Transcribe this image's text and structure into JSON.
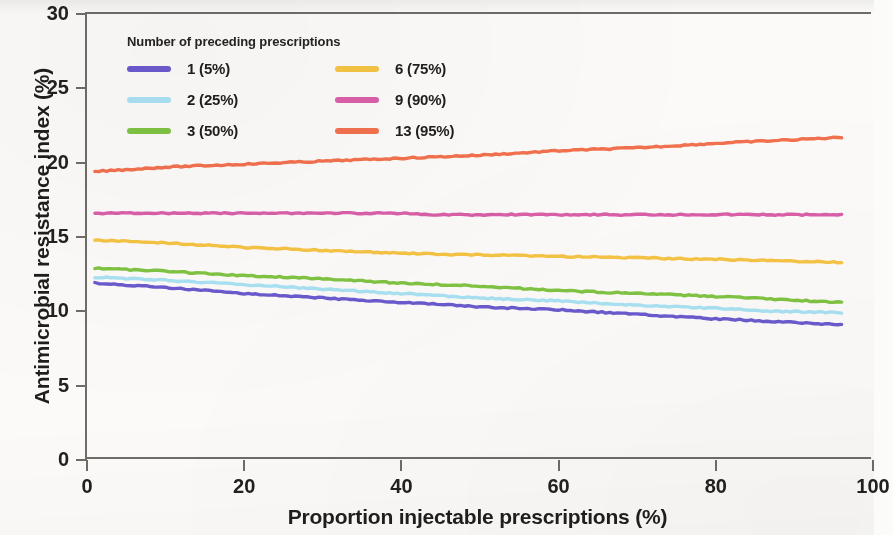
{
  "chart_data": {
    "type": "line",
    "title": "",
    "xlabel": "Proportion injectable prescriptions (%)",
    "ylabel": "Antimicrobial resistance index (%)",
    "xlim": [
      0,
      100
    ],
    "ylim": [
      0,
      30
    ],
    "xticks": [
      "0",
      "20",
      "40",
      "60",
      "80",
      "100"
    ],
    "yticks": [
      "0",
      "5",
      "10",
      "15",
      "20",
      "25",
      "30"
    ],
    "grid": false,
    "legend_position": "top-left inside axes",
    "legend_title": "Number of preceding prescriptions",
    "x_data_range": [
      1,
      96
    ],
    "series": [
      {
        "name": "1 (5%)",
        "color": "#6a5acd",
        "x": [
          1,
          10,
          20,
          30,
          40,
          50,
          60,
          70,
          80,
          88,
          96
        ],
        "values": [
          11.9,
          11.6,
          11.2,
          10.9,
          10.6,
          10.3,
          10.1,
          9.8,
          9.5,
          9.3,
          9.1
        ]
      },
      {
        "name": "2 (25%)",
        "color": "#a9e1f2",
        "x": [
          1,
          10,
          20,
          30,
          40,
          50,
          60,
          70,
          80,
          88,
          96
        ],
        "values": [
          12.3,
          12.1,
          11.8,
          11.5,
          11.2,
          10.9,
          10.7,
          10.4,
          10.2,
          10.0,
          9.9
        ]
      },
      {
        "name": "3 (50%)",
        "color": "#80c342",
        "x": [
          1,
          10,
          20,
          30,
          40,
          50,
          60,
          70,
          80,
          88,
          96
        ],
        "values": [
          12.9,
          12.7,
          12.4,
          12.2,
          11.9,
          11.7,
          11.4,
          11.2,
          11.0,
          10.8,
          10.6
        ]
      },
      {
        "name": "6 (75%)",
        "color": "#f5c444",
        "x": [
          1,
          10,
          20,
          30,
          40,
          50,
          60,
          70,
          80,
          88,
          96
        ],
        "values": [
          14.8,
          14.6,
          14.3,
          14.1,
          13.9,
          13.8,
          13.7,
          13.6,
          13.5,
          13.4,
          13.3
        ]
      },
      {
        "name": "9 (90%)",
        "color": "#d95fa8",
        "x": [
          1,
          10,
          20,
          30,
          40,
          44,
          50,
          60,
          70,
          80,
          88,
          96
        ],
        "values": [
          16.6,
          16.6,
          16.6,
          16.6,
          16.6,
          16.5,
          16.5,
          16.5,
          16.5,
          16.5,
          16.5,
          16.5
        ]
      },
      {
        "name": "13 (95%)",
        "color": "#f2714e",
        "x": [
          1,
          10,
          20,
          30,
          40,
          50,
          60,
          70,
          80,
          88,
          96
        ],
        "values": [
          19.4,
          19.7,
          19.9,
          20.1,
          20.3,
          20.5,
          20.8,
          21.0,
          21.3,
          21.5,
          21.7
        ]
      }
    ]
  },
  "legend": {
    "title": "Number of preceding prescriptions",
    "entries": [
      {
        "label": "1 (5%)",
        "color": "#6a5acd"
      },
      {
        "label": "2 (25%)",
        "color": "#a9e1f2"
      },
      {
        "label": "3 (50%)",
        "color": "#80c342"
      },
      {
        "label": "6 (75%)",
        "color": "#f5c444"
      },
      {
        "label": "9 (90%)",
        "color": "#d95fa8"
      },
      {
        "label": "13 (95%)",
        "color": "#f2714e"
      }
    ]
  },
  "axes": {
    "y_title": "Antimicrobial resistance index (%)",
    "x_title": "Proportion injectable prescriptions (%)",
    "y_ticks": [
      "30",
      "25",
      "20",
      "15",
      "10",
      "5",
      "0"
    ],
    "x_ticks": [
      "0",
      "20",
      "40",
      "60",
      "80",
      "100"
    ]
  }
}
